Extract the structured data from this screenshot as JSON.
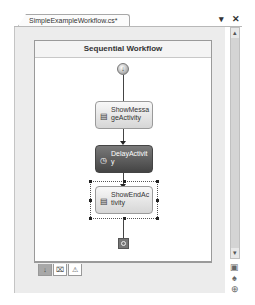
{
  "document_tab": {
    "title": "SimpleExampleWorkflow.cs*",
    "pin_icon": "▾",
    "close_icon": "✕"
  },
  "designer": {
    "title": "Sequential Workflow",
    "start_icon": "↓",
    "activities": [
      {
        "name": "ShowMessageActivity",
        "label": "ShowMessageActivity",
        "style": "light",
        "icon": "code-icon",
        "selected": false
      },
      {
        "name": "DelayActivity",
        "label": "DelayActivity",
        "style": "dark",
        "icon": "delay-icon",
        "selected": false
      },
      {
        "name": "ShowEndActivity",
        "label": "ShowEndActivity",
        "style": "light",
        "icon": "code-icon",
        "selected": true
      }
    ]
  },
  "view_tabs": [
    {
      "name": "workflow-view",
      "glyph": "↓",
      "active": true
    },
    {
      "name": "cancel-handler-view",
      "glyph": "⌧",
      "active": false
    },
    {
      "name": "fault-handler-view",
      "glyph": "⚠",
      "active": false
    }
  ],
  "scrollbar": {
    "up": "▴",
    "down": "▾"
  },
  "side_tools": [
    {
      "name": "zoom-icon",
      "glyph": "▣"
    },
    {
      "name": "pan-icon",
      "glyph": "♠"
    },
    {
      "name": "navigate-icon",
      "glyph": "⊕"
    }
  ]
}
